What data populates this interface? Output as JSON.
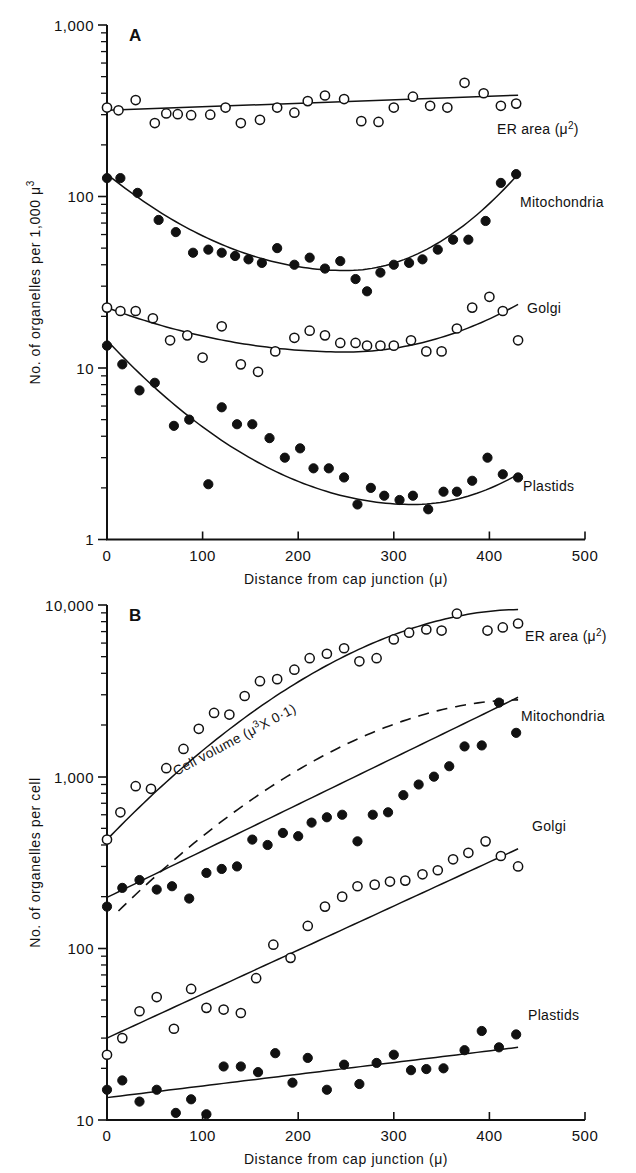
{
  "figure": {
    "panels": [
      {
        "id": "A",
        "letter": "A",
        "ylabel": "No. of organelles per 1,000 μ",
        "ylabel_exp": "3",
        "xlabel": "Distance from cap junction (μ)",
        "yticks": [
          "1,000",
          "100",
          "10",
          "1"
        ],
        "xticks": [
          "0",
          "100",
          "200",
          "300",
          "400",
          "500"
        ],
        "series_labels": {
          "er": "ER area (μ",
          "er_exp": "2",
          "er_close": ")",
          "mito": "Mitochondria",
          "golgi": "Golgi",
          "plastids": "Plastids"
        }
      },
      {
        "id": "B",
        "letter": "B",
        "ylabel": "No. of organelles per cell",
        "xlabel": "Distance from cap junction (μ)",
        "yticks": [
          "10,000",
          "1,000",
          "100",
          "10"
        ],
        "xticks": [
          "0",
          "100",
          "200",
          "300",
          "400",
          "500"
        ],
        "series_labels": {
          "er": "ER area (μ",
          "er_exp": "2",
          "er_close": ")",
          "mito": "Mitochondria",
          "golgi": "Golgi",
          "plastids": "Plastids",
          "cellvolume": "Cell volume (μ",
          "cellvolume_exp": "3",
          "cellvolume_tail": "X 0·1)"
        }
      }
    ]
  },
  "chart_data": [
    {
      "type": "scatter",
      "panel": "A",
      "title": "A",
      "xlabel": "Distance from cap junction (μ)",
      "ylabel": "No. of organelles per 1,000 μ³",
      "xlim": [
        0,
        500
      ],
      "ylim": [
        1,
        1000
      ],
      "yscale": "log",
      "grid": false,
      "xticks": [
        0,
        100,
        200,
        300,
        400,
        500
      ],
      "yticks": [
        1,
        10,
        100,
        1000
      ],
      "series": [
        {
          "name": "ER area (μ²)",
          "marker": "open-circle",
          "x": [
            0,
            12,
            30,
            50,
            62,
            74,
            88,
            108,
            124,
            140,
            160,
            178,
            196,
            210,
            228,
            248,
            266,
            284,
            300,
            320,
            338,
            356,
            374,
            394,
            412,
            428
          ],
          "y": [
            330,
            318,
            365,
            268,
            305,
            302,
            298,
            300,
            330,
            268,
            280,
            330,
            308,
            360,
            388,
            370,
            275,
            272,
            330,
            382,
            338,
            330,
            460,
            400,
            338,
            348
          ],
          "fit": {
            "type": "line",
            "x": [
              0,
              430
            ],
            "y": [
              318,
              390
            ]
          }
        },
        {
          "name": "Mitochondria",
          "marker": "filled-circle",
          "x": [
            0,
            14,
            32,
            54,
            72,
            90,
            106,
            120,
            134,
            148,
            162,
            178,
            196,
            212,
            228,
            244,
            260,
            272,
            286,
            300,
            316,
            330,
            346,
            362,
            378,
            396,
            412,
            428
          ],
          "y": [
            128,
            128,
            105,
            73,
            62,
            47,
            49,
            47,
            45,
            43,
            41,
            50,
            40,
            44,
            38,
            42,
            33,
            28,
            36,
            40,
            41,
            43,
            49,
            56,
            56,
            72,
            120,
            135,
            130
          ],
          "fit": {
            "type": "curve",
            "vertex_x": 250,
            "vertex_y": 37,
            "x0": 0,
            "y0": 135,
            "x1": 430,
            "y1": 135
          }
        },
        {
          "name": "Golgi",
          "marker": "open-circle",
          "x": [
            0,
            14,
            30,
            48,
            66,
            84,
            100,
            120,
            140,
            158,
            176,
            196,
            212,
            228,
            244,
            260,
            272,
            286,
            300,
            318,
            334,
            350,
            366,
            382,
            400,
            414,
            430
          ],
          "y": [
            22.5,
            21.5,
            21.5,
            19.5,
            14.5,
            15.5,
            11.5,
            17.5,
            10.5,
            9.5,
            12.5,
            15,
            16.5,
            15.5,
            14,
            14,
            13.5,
            13.5,
            13.5,
            14.5,
            12.5,
            12.5,
            17,
            22.5,
            26,
            21.5,
            14.5
          ],
          "fit": {
            "type": "curve",
            "vertex_x": 250,
            "vertex_y": 12.4,
            "x0": 0,
            "y0": 22.5,
            "x1": 430,
            "y1": 23.5
          }
        },
        {
          "name": "Plastids",
          "marker": "filled-circle",
          "x": [
            0,
            16,
            34,
            50,
            70,
            86,
            106,
            120,
            136,
            152,
            170,
            186,
            202,
            216,
            232,
            248,
            262,
            276,
            290,
            306,
            320,
            336,
            352,
            366,
            382,
            398,
            414,
            430
          ],
          "y": [
            13.5,
            10.5,
            7.4,
            8.2,
            4.6,
            5.0,
            2.1,
            5.9,
            4.7,
            4.7,
            3.9,
            3.0,
            3.4,
            2.6,
            2.6,
            2.3,
            1.6,
            2.0,
            1.8,
            1.7,
            1.8,
            1.5,
            1.9,
            1.9,
            2.2,
            3.0,
            2.4,
            2.3
          ],
          "fit": {
            "type": "curve",
            "vertex_x": 320,
            "vertex_y": 1.6,
            "x0": 0,
            "y0": 14.5,
            "x1": 430,
            "y1": 2.4
          }
        }
      ]
    },
    {
      "type": "scatter",
      "panel": "B",
      "title": "B",
      "xlabel": "Distance from cap junction (μ)",
      "ylabel": "No. of organelles per cell",
      "xlim": [
        0,
        500
      ],
      "ylim": [
        10,
        10000
      ],
      "yscale": "log",
      "grid": false,
      "xticks": [
        0,
        100,
        200,
        300,
        400,
        500
      ],
      "yticks": [
        10,
        100,
        1000,
        10000
      ],
      "series": [
        {
          "name": "ER area (μ²)",
          "marker": "open-circle",
          "x": [
            0,
            14,
            30,
            46,
            62,
            80,
            96,
            112,
            128,
            144,
            160,
            178,
            196,
            212,
            230,
            248,
            264,
            282,
            300,
            316,
            334,
            350,
            366,
            382,
            398,
            414,
            430
          ],
          "y": [
            430,
            620,
            880,
            850,
            1120,
            1450,
            1900,
            2350,
            2300,
            2950,
            3600,
            3700,
            4200,
            4900,
            5200,
            5600,
            4700,
            4900,
            6300,
            6900,
            7200,
            7100,
            8900,
            11200,
            7100,
            7400,
            7800
          ],
          "fit": {
            "type": "curve-saturating",
            "x0": 0,
            "y0": 430,
            "x1": 430,
            "y1": 9400
          }
        },
        {
          "name": "Mitochondria",
          "marker": "filled-circle",
          "x": [
            0,
            16,
            34,
            52,
            68,
            86,
            104,
            120,
            136,
            152,
            168,
            184,
            200,
            214,
            230,
            246,
            262,
            278,
            294,
            310,
            326,
            342,
            358,
            374,
            392,
            410,
            428
          ],
          "y": [
            175,
            225,
            250,
            220,
            230,
            195,
            275,
            290,
            300,
            430,
            400,
            470,
            450,
            540,
            580,
            600,
            420,
            600,
            620,
            780,
            900,
            1000,
            1150,
            1500,
            1520,
            2700,
            1800,
            3000
          ],
          "fit": {
            "type": "line-log",
            "x": [
              0,
              430
            ],
            "y": [
              198,
              2900
            ]
          }
        },
        {
          "name": "Golgi",
          "marker": "open-circle",
          "x": [
            0,
            16,
            34,
            52,
            70,
            88,
            104,
            122,
            140,
            156,
            174,
            192,
            210,
            228,
            246,
            262,
            280,
            296,
            312,
            330,
            346,
            362,
            378,
            396,
            412,
            430
          ],
          "y": [
            24,
            30,
            43,
            52,
            34,
            58,
            45,
            44,
            42,
            67,
            105,
            88,
            135,
            175,
            200,
            230,
            235,
            245,
            248,
            270,
            285,
            330,
            360,
            420,
            345,
            300
          ],
          "fit": {
            "type": "line-log",
            "x": [
              0,
              430
            ],
            "y": [
              30,
              380
            ]
          }
        },
        {
          "name": "Plastids",
          "marker": "filled-circle",
          "x": [
            0,
            16,
            34,
            52,
            72,
            88,
            104,
            122,
            140,
            158,
            176,
            194,
            210,
            230,
            248,
            264,
            282,
            300,
            318,
            334,
            352,
            374,
            392,
            410,
            428
          ],
          "y": [
            15,
            17,
            12.8,
            15,
            11.0,
            13.2,
            10.8,
            20.5,
            20.5,
            19.0,
            24.5,
            16.5,
            23.0,
            15.0,
            21.0,
            16.2,
            21.5,
            24.0,
            19.5,
            19.8,
            20.0,
            25.5,
            33.0,
            26.5,
            31.5
          ],
          "fit": {
            "type": "line-log",
            "x": [
              0,
              430
            ],
            "y": [
              13.5,
              26.5
            ]
          }
        },
        {
          "name": "Cell volume (μ³X 0·1)",
          "marker": "none",
          "linestyle": "dashed",
          "fit": {
            "type": "curve-saturating",
            "x0": 12,
            "y0": 165,
            "x1": 430,
            "y1": 2800
          }
        }
      ]
    }
  ]
}
